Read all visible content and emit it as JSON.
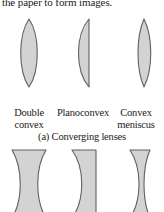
{
  "paragraph": {
    "clipped_line": "the paper to form images."
  },
  "converging": {
    "caption": "(a) Converging lenses",
    "lenses": [
      {
        "icon": "biconvex-lens-icon",
        "name": "double-convex",
        "label_line1": "Double",
        "label_line2": "convex"
      },
      {
        "icon": "planoconvex-lens-icon",
        "name": "planoconvex",
        "label_line1": "Planoconvex",
        "label_line2": ""
      },
      {
        "icon": "convex-meniscus-lens-icon",
        "name": "convex-meniscus",
        "label_line1": "Convex",
        "label_line2": "meniscus"
      }
    ]
  },
  "diverging": {
    "lenses": [
      {
        "icon": "biconcave-lens-icon",
        "name": "double-concave"
      },
      {
        "icon": "planoconcave-lens-icon",
        "name": "planoconcave"
      },
      {
        "icon": "concave-meniscus-lens-icon",
        "name": "concave-meniscus"
      }
    ]
  },
  "colors": {
    "lens_fill": "#d3d3d3",
    "lens_stroke": "#606060",
    "text": "#1a1a1a",
    "background": "#ffffff"
  }
}
